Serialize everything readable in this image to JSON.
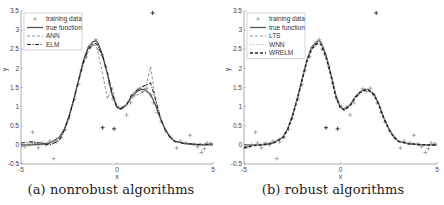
{
  "chart_data": [
    {
      "type": "line",
      "panel": "a",
      "caption": "(a) nonrobust algorithms",
      "xlabel": "x",
      "ylabel": "y",
      "xlim": [
        -5,
        5
      ],
      "ylim": [
        -0.5,
        3.5
      ],
      "xticks": [
        -5,
        0,
        5
      ],
      "yticks": [
        -0.5,
        0,
        0.5,
        1,
        1.5,
        2,
        2.5,
        3,
        3.5
      ],
      "ytick_labels": [
        "-0.5",
        "0",
        "0.5",
        "1",
        "1.5",
        "2",
        "2.5",
        "3",
        "3.5"
      ],
      "grid": false,
      "legend_position": "upper left",
      "legend": [
        "training data",
        "true function",
        "ANN",
        "ELM"
      ],
      "x": [
        -5,
        -4.5,
        -4,
        -3.5,
        -3,
        -2.75,
        -2.5,
        -2.25,
        -2,
        -1.75,
        -1.5,
        -1.25,
        -1.1,
        -1,
        -0.75,
        -0.5,
        -0.25,
        0,
        0.2,
        0.5,
        0.75,
        1,
        1.25,
        1.45,
        1.75,
        2,
        2.25,
        2.5,
        2.75,
        3,
        3.5,
        4,
        4.5,
        5
      ],
      "series": [
        {
          "name": "true function",
          "style": "solid",
          "color": "#555555",
          "values": [
            0.0,
            0.0,
            0.01,
            0.05,
            0.2,
            0.4,
            0.75,
            1.2,
            1.7,
            2.2,
            2.55,
            2.7,
            2.72,
            2.68,
            2.35,
            1.85,
            1.3,
            0.98,
            0.93,
            1.05,
            1.25,
            1.38,
            1.45,
            1.45,
            1.32,
            1.05,
            0.7,
            0.42,
            0.22,
            0.1,
            0.03,
            0.01,
            0.0,
            0.0
          ]
        },
        {
          "name": "ANN",
          "style": "dashed",
          "color": "#888888",
          "values": [
            -0.05,
            0.05,
            0.02,
            0.05,
            0.15,
            0.35,
            0.7,
            1.15,
            1.65,
            2.1,
            2.45,
            2.6,
            2.6,
            2.45,
            1.85,
            1.2,
            1.5,
            1.0,
            0.95,
            1.05,
            1.2,
            1.3,
            1.35,
            1.4,
            2.05,
            1.2,
            0.75,
            0.4,
            0.2,
            0.08,
            0.05,
            0.02,
            0.03,
            0.05
          ]
        },
        {
          "name": "ELM",
          "style": "dashdot",
          "color": "#222222",
          "values": [
            0.05,
            0.08,
            0.05,
            0.0,
            0.12,
            0.38,
            0.72,
            1.18,
            1.68,
            2.15,
            2.5,
            2.62,
            2.65,
            2.6,
            2.3,
            1.9,
            1.35,
            0.98,
            0.95,
            1.05,
            1.3,
            1.42,
            1.5,
            1.55,
            1.62,
            1.2,
            0.72,
            0.4,
            0.2,
            0.09,
            0.04,
            0.02,
            0.0,
            0.03
          ]
        }
      ],
      "training_data": [
        [
          -4.8,
          -0.05
        ],
        [
          -4.6,
          0.0
        ],
        [
          -4.4,
          0.33
        ],
        [
          -4.3,
          0.05
        ],
        [
          -4.1,
          -0.08
        ],
        [
          -3.9,
          0.05
        ],
        [
          -3.7,
          0.0
        ],
        [
          -3.5,
          0.1
        ],
        [
          -3.3,
          -0.36
        ],
        [
          -3.15,
          0.08
        ],
        [
          -2.9,
          0.2
        ],
        [
          -2.7,
          0.4
        ],
        [
          -2.5,
          0.7
        ],
        [
          -2.2,
          1.2
        ],
        [
          -2.0,
          1.58
        ],
        [
          -1.85,
          1.95
        ],
        [
          -1.6,
          2.3
        ],
        [
          -1.45,
          2.55
        ],
        [
          -1.3,
          2.62
        ],
        [
          -1.1,
          2.75
        ],
        [
          -0.95,
          2.5
        ],
        [
          -0.8,
          2.35
        ],
        [
          -0.6,
          2.05
        ],
        [
          -0.4,
          1.6
        ],
        [
          -0.2,
          1.2
        ],
        [
          0.05,
          1.0
        ],
        [
          0.3,
          0.98
        ],
        [
          0.5,
          0.78
        ],
        [
          0.7,
          1.1
        ],
        [
          0.9,
          1.3
        ],
        [
          1.15,
          1.47
        ],
        [
          1.35,
          1.4
        ],
        [
          1.55,
          1.48
        ],
        [
          1.75,
          1.3
        ],
        [
          1.9,
          1.1
        ],
        [
          2.1,
          0.85
        ],
        [
          2.3,
          0.6
        ],
        [
          2.55,
          0.35
        ],
        [
          2.8,
          0.2
        ],
        [
          3.1,
          -0.08
        ],
        [
          3.3,
          0.1
        ],
        [
          3.6,
          0.05
        ],
        [
          3.8,
          0.25
        ],
        [
          4.0,
          0.02
        ],
        [
          4.2,
          -0.05
        ],
        [
          4.4,
          -0.2
        ],
        [
          4.55,
          -0.1
        ],
        [
          4.7,
          0.05
        ],
        [
          4.9,
          0.03
        ],
        [
          1.85,
          3.45
        ],
        [
          -0.75,
          0.45
        ],
        [
          -0.15,
          0.42
        ]
      ]
    },
    {
      "type": "line",
      "panel": "b",
      "caption": "(b) robust algorithms",
      "xlabel": "x",
      "ylabel": "y",
      "xlim": [
        -5,
        5
      ],
      "ylim": [
        -0.5,
        3.5
      ],
      "xticks": [
        -5,
        0,
        5
      ],
      "yticks": [
        -0.5,
        0,
        0.5,
        1,
        1.5,
        2,
        2.5,
        3,
        3.5
      ],
      "ytick_labels": [
        "-0.5",
        "0",
        "0.5",
        "1",
        "1.5",
        "2",
        "2.5",
        "3",
        "3.5"
      ],
      "grid": false,
      "legend_position": "upper left",
      "legend": [
        "training data",
        "true function",
        "LTS",
        "WNN",
        "WRELM"
      ],
      "x": [
        -5,
        -4.5,
        -4,
        -3.5,
        -3,
        -2.75,
        -2.5,
        -2.25,
        -2,
        -1.75,
        -1.5,
        -1.25,
        -1.1,
        -1,
        -0.75,
        -0.5,
        -0.25,
        0,
        0.2,
        0.5,
        0.75,
        1,
        1.25,
        1.45,
        1.75,
        2,
        2.25,
        2.5,
        2.75,
        3,
        3.5,
        4,
        4.5,
        5
      ],
      "series": [
        {
          "name": "true function",
          "style": "solid",
          "color": "#555555",
          "values": [
            0.0,
            0.0,
            0.01,
            0.05,
            0.2,
            0.4,
            0.75,
            1.2,
            1.7,
            2.2,
            2.55,
            2.7,
            2.72,
            2.68,
            2.35,
            1.85,
            1.3,
            0.98,
            0.93,
            1.05,
            1.25,
            1.38,
            1.45,
            1.45,
            1.32,
            1.05,
            0.7,
            0.42,
            0.22,
            0.1,
            0.03,
            0.01,
            0.0,
            0.0
          ]
        },
        {
          "name": "LTS",
          "style": "dashed",
          "color": "#888888",
          "values": [
            -0.05,
            0.0,
            0.02,
            0.06,
            0.2,
            0.4,
            0.74,
            1.18,
            1.68,
            2.18,
            2.52,
            2.66,
            2.68,
            2.64,
            2.3,
            1.82,
            1.28,
            0.97,
            0.92,
            1.04,
            1.24,
            1.37,
            1.44,
            1.44,
            1.31,
            1.04,
            0.7,
            0.42,
            0.22,
            0.1,
            0.03,
            0.01,
            0.0,
            0.0
          ]
        },
        {
          "name": "WNN",
          "style": "dotted",
          "color": "#bbbbbb",
          "values": [
            -0.02,
            0.01,
            0.02,
            0.05,
            0.19,
            0.39,
            0.74,
            1.19,
            1.69,
            2.19,
            2.53,
            2.68,
            2.7,
            2.66,
            2.33,
            1.84,
            1.3,
            0.98,
            0.93,
            1.05,
            1.25,
            1.38,
            1.45,
            1.45,
            1.32,
            1.05,
            0.7,
            0.42,
            0.22,
            0.1,
            0.03,
            0.01,
            0.0,
            0.0
          ]
        },
        {
          "name": "WRELM",
          "style": "dashed-bold",
          "color": "#222222",
          "values": [
            -0.08,
            -0.02,
            0.0,
            0.04,
            0.18,
            0.38,
            0.73,
            1.17,
            1.67,
            2.17,
            2.5,
            2.64,
            2.66,
            2.62,
            2.3,
            1.82,
            1.27,
            0.96,
            0.91,
            1.03,
            1.23,
            1.36,
            1.43,
            1.43,
            1.3,
            1.03,
            0.69,
            0.41,
            0.21,
            0.09,
            0.03,
            0.01,
            0.0,
            0.0
          ]
        }
      ],
      "training_data": [
        [
          -4.8,
          -0.05
        ],
        [
          -4.6,
          0.0
        ],
        [
          -4.4,
          0.33
        ],
        [
          -4.3,
          0.05
        ],
        [
          -4.1,
          -0.08
        ],
        [
          -3.9,
          0.05
        ],
        [
          -3.7,
          0.0
        ],
        [
          -3.5,
          0.1
        ],
        [
          -3.3,
          -0.36
        ],
        [
          -3.15,
          0.08
        ],
        [
          -2.9,
          0.2
        ],
        [
          -2.7,
          0.4
        ],
        [
          -2.5,
          0.7
        ],
        [
          -2.2,
          1.2
        ],
        [
          -2.0,
          1.58
        ],
        [
          -1.85,
          1.95
        ],
        [
          -1.6,
          2.3
        ],
        [
          -1.45,
          2.55
        ],
        [
          -1.3,
          2.62
        ],
        [
          -1.1,
          2.75
        ],
        [
          -0.95,
          2.5
        ],
        [
          -0.8,
          2.35
        ],
        [
          -0.6,
          2.05
        ],
        [
          -0.4,
          1.6
        ],
        [
          -0.2,
          1.2
        ],
        [
          0.05,
          1.0
        ],
        [
          0.3,
          0.98
        ],
        [
          0.5,
          0.78
        ],
        [
          0.7,
          1.1
        ],
        [
          0.9,
          1.3
        ],
        [
          1.15,
          1.47
        ],
        [
          1.35,
          1.4
        ],
        [
          1.55,
          1.48
        ],
        [
          1.75,
          1.3
        ],
        [
          1.9,
          1.1
        ],
        [
          2.1,
          0.85
        ],
        [
          2.3,
          0.6
        ],
        [
          2.55,
          0.35
        ],
        [
          2.8,
          0.2
        ],
        [
          3.1,
          -0.08
        ],
        [
          3.3,
          0.1
        ],
        [
          3.6,
          0.05
        ],
        [
          3.8,
          0.25
        ],
        [
          4.0,
          0.02
        ],
        [
          4.2,
          -0.05
        ],
        [
          4.4,
          -0.2
        ],
        [
          4.55,
          -0.1
        ],
        [
          4.7,
          0.05
        ],
        [
          4.9,
          0.03
        ],
        [
          1.85,
          3.45
        ],
        [
          -0.75,
          0.45
        ],
        [
          -0.15,
          0.42
        ]
      ]
    }
  ],
  "panels": {
    "left": {
      "caption": "(a) nonrobust algorithms",
      "xlabel": "x",
      "ylabel": "y"
    },
    "right": {
      "caption": "(b) robust algorithms",
      "xlabel": "x",
      "ylabel": "y"
    }
  },
  "colors": {
    "axis": "#999999",
    "training_marker": "#888888",
    "outlier_marker": "#444444"
  }
}
